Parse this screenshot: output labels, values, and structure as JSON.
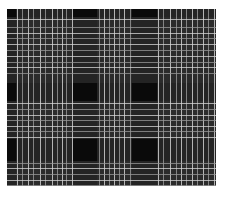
{
  "image": {
    "subject": "black, gray and white tartan plaid fabric pattern",
    "colors": {
      "background": "#ffffff",
      "base": "#0a0a0a",
      "gray_band": "#2e2e2e",
      "light_line": "#d8d8d8",
      "mid_line": "#9a9a9a"
    },
    "bounds": {
      "left": 7,
      "top": 9,
      "width": 209,
      "height": 177
    },
    "vertical_bands": [
      {
        "x": 9,
        "width": 57
      },
      {
        "x": 90,
        "width": 35
      },
      {
        "x": 150,
        "width": 59
      }
    ],
    "horizontal_bands": [
      {
        "y": 8,
        "width": 66
      },
      {
        "y": 92,
        "width": 38
      },
      {
        "y": 152,
        "width": 25
      }
    ],
    "vertical_lines": [
      10,
      15,
      21,
      26,
      33,
      38,
      45,
      50,
      55,
      59,
      65,
      92,
      97,
      102,
      107,
      112,
      117,
      123,
      151,
      156,
      163,
      169,
      174,
      179,
      185,
      190,
      196,
      201,
      207
    ],
    "horizontal_lines": [
      10,
      18,
      24,
      29,
      35,
      41,
      47,
      53,
      58,
      64,
      94,
      100,
      106,
      111,
      117,
      122,
      128,
      154,
      159,
      165,
      171,
      176
    ]
  }
}
